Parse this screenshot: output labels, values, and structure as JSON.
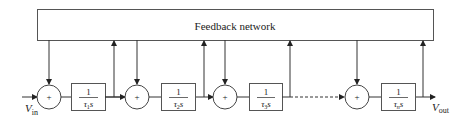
{
  "diagram": {
    "feedback_network": {
      "label": "Feedback network"
    },
    "input": {
      "symbol": "V",
      "subscript": "in"
    },
    "output": {
      "symbol": "V",
      "subscript": "out"
    },
    "summing_junctions": [
      {
        "id": "sum1",
        "sign": "+"
      },
      {
        "id": "sum2",
        "sign": "+"
      },
      {
        "id": "sum3",
        "sign": "+"
      },
      {
        "id": "sumN",
        "sign": "+"
      }
    ],
    "integrators": [
      {
        "id": "int1",
        "numerator": "1",
        "tau": "τ",
        "index": "1",
        "var": "s"
      },
      {
        "id": "int2",
        "numerator": "1",
        "tau": "τ",
        "index": "2",
        "var": "s"
      },
      {
        "id": "int3",
        "numerator": "1",
        "tau": "τ",
        "index": "3",
        "var": "s"
      },
      {
        "id": "intN",
        "numerator": "1",
        "tau": "τ",
        "index": "n",
        "var": "s"
      }
    ],
    "colors": {
      "line": "#333333",
      "background": "#ffffff"
    }
  }
}
